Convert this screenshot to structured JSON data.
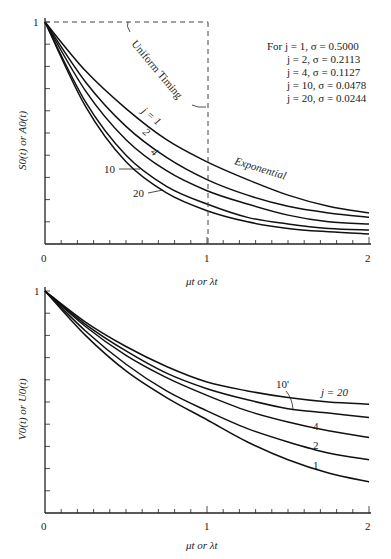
{
  "chart_data": [
    {
      "type": "line",
      "title": "",
      "xlabel": "μt or λt",
      "ylabel": "S0(t) or A0(t)",
      "xlim": [
        0,
        2
      ],
      "ylim": [
        0,
        1
      ],
      "x_ticks": [
        "0",
        "1",
        "2"
      ],
      "y_ticks": [
        "0",
        "1"
      ],
      "grid": false,
      "legend_text": [
        "For j = 1, σ = 0.5000",
        "j = 2, σ = 0.2113",
        "j = 4, σ = 0.1127",
        "j = 10, σ = 0.0478",
        "j = 20, σ = 0.0244"
      ],
      "annotations": [
        "Uniform Timing",
        "Exponential",
        "j = 1",
        "2",
        "4",
        "10",
        "20"
      ],
      "x": [
        0,
        0.25,
        0.5,
        0.75,
        1.0,
        1.25,
        1.5,
        1.75,
        2.0
      ],
      "series": [
        {
          "name": "Exponential",
          "values": [
            1.0,
            0.78,
            0.61,
            0.47,
            0.37,
            0.29,
            0.22,
            0.17,
            0.14
          ]
        },
        {
          "name": "j = 1",
          "values": [
            1.0,
            0.73,
            0.53,
            0.39,
            0.29,
            0.22,
            0.17,
            0.14,
            0.12
          ]
        },
        {
          "name": "j = 2",
          "values": [
            1.0,
            0.69,
            0.47,
            0.33,
            0.24,
            0.18,
            0.13,
            0.1,
            0.09
          ]
        },
        {
          "name": "j = 10",
          "values": [
            1.0,
            0.64,
            0.4,
            0.26,
            0.18,
            0.12,
            0.09,
            0.07,
            0.063
          ]
        },
        {
          "name": "j = 20",
          "values": [
            1.0,
            0.62,
            0.37,
            0.23,
            0.15,
            0.1,
            0.07,
            0.055,
            0.045
          ]
        },
        {
          "name": "Uniform Timing",
          "values": [
            1.0,
            1.0,
            1.0,
            1.0,
            1.0,
            0,
            0,
            0,
            0
          ]
        }
      ]
    },
    {
      "type": "line",
      "title": "",
      "xlabel": "μt or λt",
      "ylabel": "V0(t) or U0(t)",
      "xlim": [
        0,
        2
      ],
      "ylim": [
        0,
        1
      ],
      "x_ticks": [
        "0",
        "1",
        "2"
      ],
      "y_ticks": [
        "1"
      ],
      "grid": false,
      "annotations": [
        "10'",
        "j = 20",
        "4",
        "2",
        "1"
      ],
      "x": [
        0,
        0.25,
        0.5,
        0.75,
        1.0,
        1.25,
        1.5,
        1.75,
        2.0
      ],
      "series": [
        {
          "name": "j = 20",
          "values": [
            1.0,
            0.86,
            0.75,
            0.66,
            0.59,
            0.55,
            0.52,
            0.5,
            0.49
          ]
        },
        {
          "name": "j = 10",
          "values": [
            1.0,
            0.85,
            0.73,
            0.63,
            0.56,
            0.51,
            0.47,
            0.45,
            0.43
          ]
        },
        {
          "name": "j = 4",
          "values": [
            1.0,
            0.84,
            0.71,
            0.61,
            0.53,
            0.46,
            0.41,
            0.37,
            0.34
          ]
        },
        {
          "name": "j = 2",
          "values": [
            1.0,
            0.82,
            0.67,
            0.55,
            0.46,
            0.38,
            0.32,
            0.27,
            0.24
          ]
        },
        {
          "name": "j = 1",
          "values": [
            1.0,
            0.8,
            0.64,
            0.52,
            0.42,
            0.32,
            0.24,
            0.18,
            0.14
          ]
        }
      ]
    }
  ],
  "labels": {
    "top": {
      "ylabel": "S0(t) or A0(t)",
      "xlabel": "μt or λt",
      "x0": "0",
      "x1": "1",
      "x2": "2",
      "y1": "1",
      "uniform": "Uniform Timing",
      "exponential": "Exponential",
      "j1": "j = 1",
      "j2": "2",
      "j4": "4",
      "j10": "10",
      "j20": "20",
      "legend": [
        "For  j =  1, σ = 0.5000",
        "j =  2, σ = 0.2113",
        "j =  4, σ = 0.1127",
        "j = 10, σ = 0.0478",
        "j = 20, σ = 0.0244"
      ]
    },
    "bottom": {
      "ylabel": "V0(t) or U0(t)",
      "xlabel": "μt or λt",
      "x0": "0",
      "x1": "1",
      "x2": "2",
      "y1": "1",
      "j20": "j = 20",
      "j10": "10'",
      "j4": "4",
      "j2": "2",
      "j1": "1"
    }
  }
}
